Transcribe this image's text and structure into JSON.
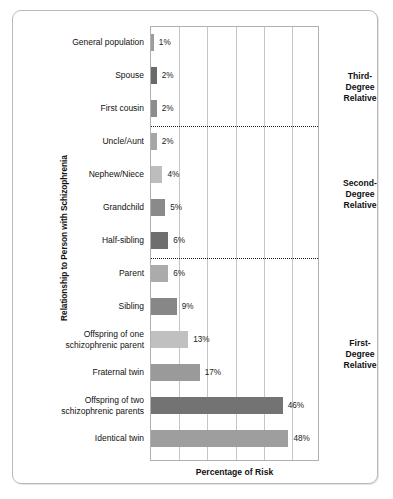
{
  "chart": {
    "title": "",
    "xlabel": "Percentage of Risk",
    "ylabel": "Relationship to Person with Schizophrenia"
  },
  "groups": [
    {
      "name": "third-degree",
      "label": "Third-\nDegree\nRelative",
      "top": 60
    },
    {
      "name": "second-degree",
      "label": "Second-\nDegree\nRelative",
      "top": 167
    },
    {
      "name": "first-degree",
      "label": "First-\nDegree\nRelative",
      "top": 327
    }
  ],
  "chart_data": {
    "type": "bar",
    "orientation": "horizontal",
    "title": "",
    "xlabel": "Percentage of Risk",
    "ylabel": "Relationship to Person with Schizophrenia",
    "xlim": [
      0,
      59
    ],
    "grid": "vertical",
    "gridline_step_px": 28.2,
    "legend": "none",
    "categories": [
      "General population",
      "Spouse",
      "First cousin",
      "Uncle/Aunt",
      "Nephew/Niece",
      "Grandchild",
      "Half-sibling",
      "Parent",
      "Sibling",
      "Offspring of one\nschizophrenic parent",
      "Fraternal twin",
      "Offspring of two\nschizophrenic parents",
      "Identical twin"
    ],
    "values": [
      1,
      2,
      2,
      2,
      4,
      5,
      6,
      6,
      9,
      13,
      17,
      46,
      48
    ],
    "value_labels": [
      "1%",
      "2%",
      "2%",
      "2%",
      "4%",
      "5%",
      "6%",
      "6%",
      "9%",
      "13%",
      "17%",
      "46%",
      "48%"
    ],
    "bar_colors": [
      "#9d9d9d",
      "#6a6a6a",
      "#8c8c8c",
      "#a6a6a6",
      "#bdbdbd",
      "#8a8a8a",
      "#6e6e6e",
      "#ababab",
      "#878787",
      "#c0c0c0",
      "#9a9a9a",
      "#737373",
      "#9e9e9e"
    ],
    "group_annotations": [
      {
        "label": "Third-Degree Relative",
        "categories": [
          "General population",
          "Spouse",
          "First cousin"
        ]
      },
      {
        "label": "Second-Degree Relative",
        "categories": [
          "Uncle/Aunt",
          "Nephew/Niece",
          "Grandchild",
          "Half-sibling"
        ]
      },
      {
        "label": "First-Degree Relative",
        "categories": [
          "Parent",
          "Sibling",
          "Offspring of one schizophrenic parent",
          "Fraternal twin",
          "Offspring of two schizophrenic parents",
          "Identical twin"
        ]
      }
    ],
    "separators_after": [
      "First cousin",
      "Half-sibling"
    ]
  }
}
